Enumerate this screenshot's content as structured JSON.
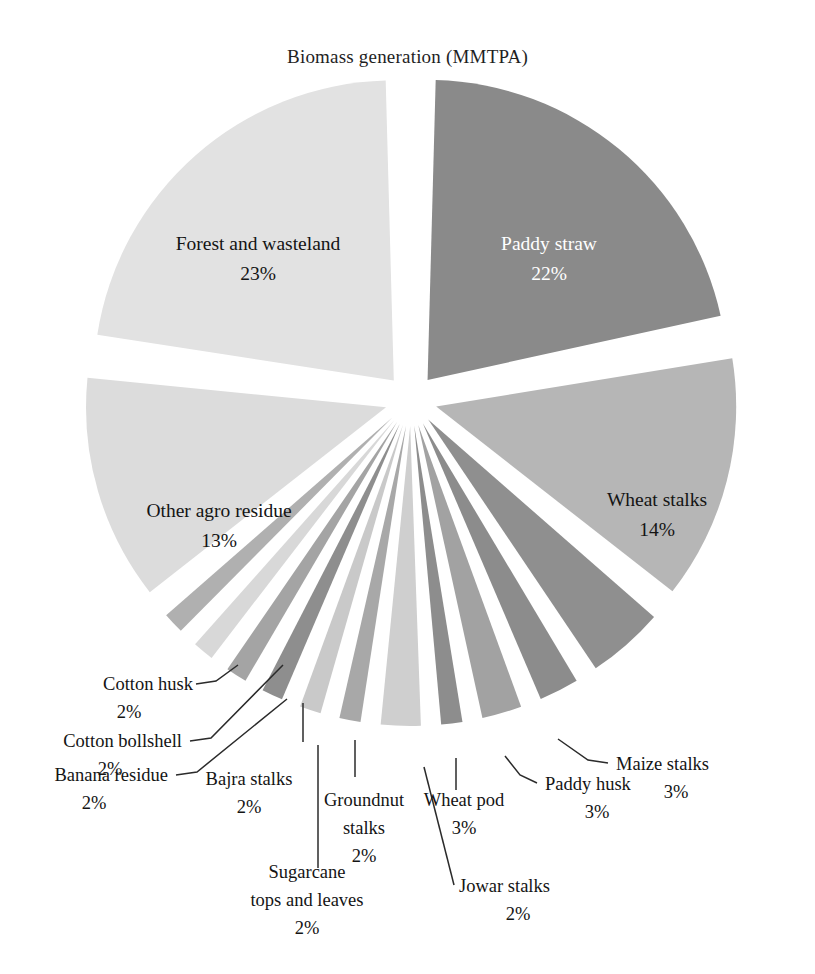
{
  "chart_data": {
    "type": "pie",
    "title": "Biomass generation (MMTPA)",
    "xlabel": "",
    "ylabel": "",
    "legend": "none",
    "units": "percent",
    "categories": [
      "Paddy straw",
      "Wheat stalks",
      "Cotton stalks",
      "Maize stalks",
      "Paddy husk",
      "Jowar stalks",
      "Wheat pod",
      "Groundnut stalks",
      "Sugarcane tops and leaves",
      "Bajra stalks",
      "Banana residue",
      "Cotton bollshell",
      "Cotton husk",
      "Other agro residue",
      "Forest and wasteland"
    ],
    "values": [
      22,
      14,
      5,
      3,
      3,
      2,
      3,
      2,
      2,
      2,
      2,
      2,
      2,
      13,
      23
    ],
    "slices": [
      {
        "label": "Paddy straw",
        "percent": 22,
        "percent_text": "22%",
        "color": "#8a8a8a",
        "label_placement": "inside",
        "label_color": "#ffffff"
      },
      {
        "label": "Wheat stalks",
        "percent": 14,
        "percent_text": "14%",
        "color": "#b6b6b6",
        "label_placement": "inside",
        "label_color": "#141414"
      },
      {
        "label": "Cotton stalks",
        "percent": 5,
        "percent_text": "5%",
        "color": "#8f8f8f",
        "label_placement": "inside",
        "label_color": "#ffffff"
      },
      {
        "label": "Maize stalks",
        "percent": 3,
        "percent_text": "3%",
        "color": "#8c8c8c",
        "label_placement": "callout",
        "label_color": "#141414"
      },
      {
        "label": "Paddy husk",
        "percent": 3,
        "percent_text": "3%",
        "color": "#a2a2a2",
        "label_placement": "callout",
        "label_color": "#141414"
      },
      {
        "label": "Jowar stalks",
        "percent": 2,
        "percent_text": "2%",
        "color": "#8d8d8d",
        "label_placement": "callout",
        "label_color": "#141414"
      },
      {
        "label": "Wheat pod",
        "percent": 3,
        "percent_text": "3%",
        "color": "#cfcfcf",
        "label_placement": "callout",
        "label_color": "#141414"
      },
      {
        "label": "Groundnut stalks",
        "percent": 2,
        "percent_text": "2%",
        "color": "#a8a8a8",
        "label_placement": "callout",
        "label_color": "#141414"
      },
      {
        "label": "Sugarcane tops and leaves",
        "percent": 2,
        "percent_text": "2%",
        "color": "#c9c9c9",
        "label_placement": "callout",
        "label_color": "#141414"
      },
      {
        "label": "Bajra stalks",
        "percent": 2,
        "percent_text": "2%",
        "color": "#8e8e8e",
        "label_placement": "callout",
        "label_color": "#141414"
      },
      {
        "label": "Banana residue",
        "percent": 2,
        "percent_text": "2%",
        "color": "#a4a4a4",
        "label_placement": "callout",
        "label_color": "#141414"
      },
      {
        "label": "Cotton bollshell",
        "percent": 2,
        "percent_text": "2%",
        "color": "#d8d8d8",
        "label_placement": "callout",
        "label_color": "#141414"
      },
      {
        "label": "Cotton husk",
        "percent": 2,
        "percent_text": "2%",
        "color": "#b0b0b0",
        "label_placement": "callout",
        "label_color": "#141414"
      },
      {
        "label": "Other agro residue",
        "percent": 13,
        "percent_text": "13%",
        "color": "#dcdcdc",
        "label_placement": "inside",
        "label_color": "#141414"
      },
      {
        "label": "Forest and wasteland",
        "percent": 23,
        "percent_text": "23%",
        "color": "#e2e2e2",
        "label_placement": "inside",
        "label_color": "#141414"
      }
    ]
  },
  "labels": {
    "paddy_straw": "Paddy straw",
    "paddy_straw_pct": "22%",
    "wheat_stalks": "Wheat stalks",
    "wheat_stalks_pct": "14%",
    "cotton_stalks_l1": "Cotton",
    "cotton_stalks_l2": "stalks",
    "cotton_stalks_pct": "5%",
    "forest": "Forest and wasteland",
    "forest_pct": "23%",
    "other_agro": "Other agro residue",
    "other_agro_pct": "13%",
    "cotton_husk": "Cotton husk",
    "cotton_husk_pct": "2%",
    "cotton_bollshell": "Cotton bollshell",
    "cotton_bollshell_pct": "2%",
    "banana_residue": "Banana residue",
    "banana_residue_pct": "2%",
    "bajra_stalks": "Bajra stalks",
    "bajra_stalks_pct": "2%",
    "sugarcane_l1": "Sugarcane",
    "sugarcane_l2": "tops and leaves",
    "sugarcane_pct": "2%",
    "groundnut_l1": "Groundnut",
    "groundnut_l2": "stalks",
    "groundnut_pct": "2%",
    "wheat_pod": "Wheat pod",
    "wheat_pod_pct": "3%",
    "jowar_stalks": "Jowar stalks",
    "jowar_stalks_pct": "2%",
    "paddy_husk": "Paddy husk",
    "paddy_husk_pct": "3%",
    "maize_stalks": "Maize stalks",
    "maize_stalks_pct": "3%"
  }
}
